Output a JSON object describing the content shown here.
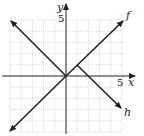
{
  "graph": {
    "x_axis_label": "x",
    "y_axis_label": "y",
    "x_tick_label": "5",
    "y_tick_label": "5",
    "range": {
      "xmin": -5,
      "xmax": 5,
      "ymin": -5,
      "ymax": 5
    },
    "grid": true,
    "curves": [
      {
        "name": "f",
        "label": "f",
        "description": "line y = x through origin, arrows both ends",
        "points": [
          [
            -5,
            -5
          ],
          [
            5.2,
            4.9
          ]
        ]
      },
      {
        "name": "left-branch",
        "description": "ray y = -x for x <= 0, arrow at upper left",
        "points": [
          [
            -5,
            5
          ],
          [
            0,
            0
          ]
        ]
      },
      {
        "name": "h",
        "label": "h",
        "description": "ray from vertex (1,1) with slope -1, arrow at lower right",
        "points": [
          [
            1,
            1
          ],
          [
            5,
            -3
          ]
        ]
      }
    ]
  }
}
